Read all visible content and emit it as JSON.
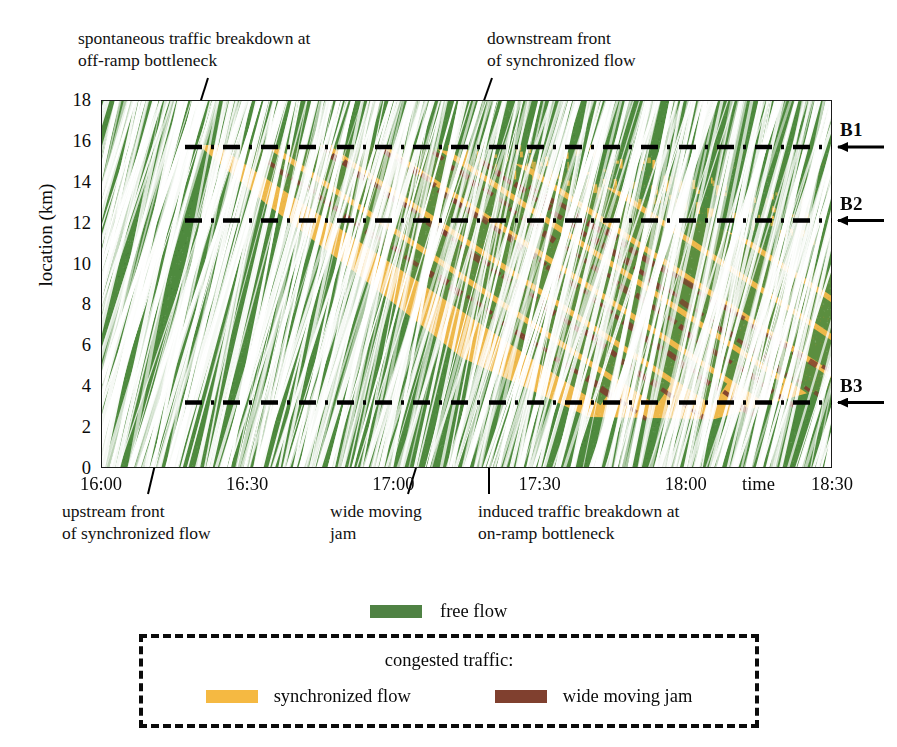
{
  "figure": {
    "kind": "traffic-spatiotemporal-diagram"
  },
  "axes": {
    "y": {
      "label": "location (km)",
      "ticks": [
        "18",
        "16",
        "14",
        "12",
        "10",
        "8",
        "6",
        "4",
        "2",
        "0"
      ],
      "values": [
        18,
        16,
        14,
        12,
        10,
        8,
        6,
        4,
        2,
        0
      ],
      "min": 0,
      "max": 18
    },
    "x": {
      "label": "time",
      "ticks": [
        "16:00",
        "16:30",
        "17:00",
        "17:30",
        "18:00",
        "18:30"
      ],
      "values": [
        0,
        30,
        60,
        90,
        120,
        150
      ],
      "min": 0,
      "max": 150
    }
  },
  "annotations": {
    "spontaneous": "spontaneous traffic breakdown at\noff-ramp bottleneck",
    "downstream": "downstream front\nof synchronized flow",
    "upstream": "upstream front\nof synchronized flow",
    "wide_moving_jam": "wide moving\njam",
    "induced": "induced traffic breakdown at\non-ramp bottleneck"
  },
  "bottlenecks": [
    {
      "id": "B1",
      "label": "B1",
      "location_km": 15.7
    },
    {
      "id": "B2",
      "label": "B2",
      "location_km": 12.1
    },
    {
      "id": "B3",
      "label": "B3",
      "location_km": 3.2
    }
  ],
  "legend": {
    "free_flow": {
      "label": "free flow",
      "color": "#4f8244"
    },
    "congested_title": "congested traffic:",
    "synchronized_flow": {
      "label": "synchronized flow",
      "color": "#f5b942"
    },
    "wide_moving_jam": {
      "label": "wide moving jam",
      "color": "#80402f"
    }
  },
  "colors": {
    "free_flow": "#4e8a3e",
    "synchronized_flow": "#eeb84a",
    "wide_moving_jam": "#7d3f2e",
    "trajectory": "#ffffff",
    "axis": "#1b1b1b",
    "text": "#111111"
  },
  "chart_data": {
    "type": "heatmap",
    "title": "",
    "xlabel": "time",
    "ylabel": "location (km)",
    "xlim": [
      0,
      150
    ],
    "ylim": [
      0,
      18
    ],
    "grid": false,
    "legend_position": "bottom",
    "categories": [
      "free flow",
      "synchronized flow",
      "wide moving jam"
    ],
    "regions": [
      {
        "name": "synchronized flow",
        "color": "#eeb84a",
        "description": "wedge spreading upstream and downstream from breakdown at B1",
        "polygon_km_min": [
          [
            20,
            15.7
          ],
          [
            47,
            15.7
          ],
          [
            118,
            2.6
          ],
          [
            96,
            2.6
          ],
          [
            20,
            15.7
          ]
        ]
      }
    ],
    "jams": [
      {
        "name": "wide moving jam",
        "start_time_min": 34,
        "start_km": 15.0,
        "end_time_min": 112,
        "end_km": 2.4
      },
      {
        "name": "wide moving jam",
        "start_time_min": 46,
        "start_km": 15.6,
        "end_time_min": 124,
        "end_km": 2.4
      },
      {
        "name": "wide moving jam",
        "start_time_min": 58,
        "start_km": 15.6,
        "end_time_min": 134,
        "end_km": 2.6
      },
      {
        "name": "wide moving jam",
        "start_time_min": 68,
        "start_km": 15.4,
        "end_time_min": 142,
        "end_km": 3.0
      },
      {
        "name": "wide moving jam",
        "start_time_min": 78,
        "start_km": 15.0,
        "end_time_min": 148,
        "end_km": 3.4
      },
      {
        "name": "wide moving jam",
        "start_time_min": 88,
        "start_km": 13.8,
        "end_time_min": 150,
        "end_km": 4.6
      }
    ],
    "events": [
      {
        "name": "spontaneous traffic breakdown at off-ramp bottleneck",
        "time_min": 20,
        "location_km": 15.7
      },
      {
        "name": "induced traffic breakdown at on-ramp bottleneck",
        "time_min": 76,
        "location_km": 3.2
      }
    ]
  }
}
